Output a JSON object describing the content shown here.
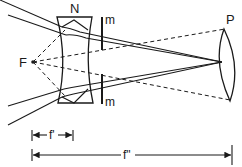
{
  "diagram": {
    "type": "optics-ray-diagram",
    "labels": {
      "focal_point": "F",
      "diverging_lens": "N",
      "stop_top": "m",
      "stop_bottom": "m",
      "converging_lens": "P",
      "short_focal_length": "f'",
      "long_focal_length": "f\""
    },
    "colors": {
      "ink": "#1a1a1a",
      "background": "#ffffff"
    }
  }
}
